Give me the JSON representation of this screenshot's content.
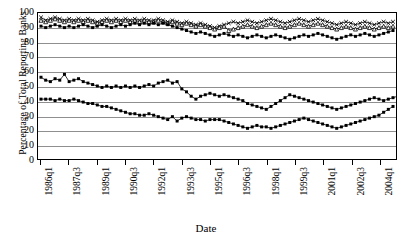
{
  "chart_data": {
    "type": "line",
    "title": "",
    "xlabel": "Date",
    "ylabel": "Percentage of Total Reporting Banks",
    "ylim": [
      0,
      100
    ],
    "yticks": [
      0,
      10,
      20,
      30,
      40,
      50,
      60,
      70,
      80,
      90,
      100
    ],
    "grid": true,
    "legend": "none",
    "x_tick_labels": [
      "1986q1",
      "1987q3",
      "1989q1",
      "1990q3",
      "1992q1",
      "1993q3",
      "1995q1",
      "1996q3",
      "1998q1",
      "1999q3",
      "2001q1",
      "2002q3",
      "2004q1"
    ],
    "x_tick_indices": [
      0,
      6,
      12,
      18,
      24,
      30,
      36,
      42,
      48,
      54,
      60,
      66,
      72
    ],
    "x_start": "1986q1",
    "x_end": "2004q4",
    "n_points": 76,
    "series": [
      {
        "name": "Series A (upper, x markers)",
        "marker": "x",
        "values": [
          97,
          95,
          96,
          97,
          96,
          95,
          96,
          95,
          96,
          95,
          96,
          95,
          94,
          95,
          96,
          95,
          96,
          95,
          96,
          95,
          96,
          95,
          96,
          95,
          95,
          96,
          95,
          94,
          95,
          94,
          93,
          94,
          93,
          92,
          93,
          92,
          91,
          90,
          91,
          92,
          93,
          94,
          93,
          94,
          95,
          94,
          93,
          94,
          95,
          96,
          95,
          94,
          93,
          94,
          95,
          96,
          95,
          94,
          95,
          96,
          95,
          94,
          93,
          92,
          93,
          94,
          93,
          92,
          93,
          94,
          93,
          92,
          93,
          94,
          93,
          94
        ]
      },
      {
        "name": "Series B (upper, triangle markers)",
        "marker": "triangle",
        "values": [
          95,
          94,
          95,
          96,
          95,
          94,
          95,
          94,
          95,
          94,
          95,
          94,
          93,
          94,
          95,
          94,
          95,
          94,
          95,
          94,
          95,
          94,
          95,
          94,
          94,
          95,
          94,
          93,
          94,
          93,
          92,
          93,
          92,
          91,
          92,
          91,
          90,
          89,
          90,
          91,
          88,
          89,
          90,
          91,
          92,
          91,
          90,
          91,
          92,
          93,
          92,
          91,
          90,
          91,
          92,
          93,
          92,
          91,
          92,
          93,
          92,
          91,
          90,
          89,
          90,
          91,
          90,
          89,
          90,
          91,
          90,
          89,
          90,
          91,
          90,
          91
        ]
      },
      {
        "name": "Series C (upper, filled square markers)",
        "marker": "square",
        "values": [
          91,
          90,
          91,
          92,
          91,
          90,
          91,
          90,
          91,
          92,
          91,
          90,
          91,
          92,
          91,
          90,
          91,
          92,
          91,
          92,
          93,
          92,
          93,
          92,
          93,
          92,
          93,
          92,
          91,
          90,
          89,
          88,
          87,
          86,
          87,
          86,
          85,
          84,
          85,
          86,
          85,
          84,
          85,
          84,
          83,
          84,
          85,
          84,
          83,
          84,
          85,
          84,
          83,
          82,
          83,
          84,
          85,
          84,
          85,
          86,
          85,
          84,
          83,
          82,
          83,
          84,
          85,
          84,
          85,
          86,
          85,
          84,
          85,
          86,
          87,
          88
        ]
      },
      {
        "name": "Series D (lower, ~50%)",
        "marker": "square",
        "values": [
          56,
          54,
          53,
          55,
          54,
          58,
          53,
          54,
          55,
          53,
          52,
          51,
          50,
          49,
          50,
          49,
          50,
          49,
          50,
          49,
          50,
          49,
          50,
          51,
          50,
          52,
          53,
          54,
          52,
          53,
          48,
          46,
          43,
          41,
          43,
          44,
          45,
          44,
          43,
          44,
          43,
          42,
          41,
          40,
          38,
          37,
          36,
          35,
          34,
          36,
          38,
          40,
          42,
          44,
          43,
          42,
          41,
          40,
          39,
          38,
          37,
          36,
          35,
          34,
          35,
          36,
          37,
          38,
          39,
          40,
          41,
          42,
          41,
          40,
          41,
          42,
          43
        ]
      },
      {
        "name": "Series E (lowest, ~30%)",
        "marker": "square",
        "values": [
          41,
          41,
          41,
          40,
          41,
          40,
          40,
          41,
          40,
          39,
          38,
          38,
          37,
          36,
          36,
          35,
          34,
          33,
          32,
          31,
          31,
          30,
          30,
          31,
          30,
          29,
          28,
          27,
          29,
          26,
          28,
          29,
          28,
          27,
          27,
          26,
          27,
          27,
          27,
          26,
          25,
          24,
          23,
          22,
          21,
          22,
          23,
          22,
          22,
          21,
          22,
          23,
          24,
          25,
          26,
          27,
          28,
          27,
          26,
          25,
          24,
          23,
          22,
          21,
          22,
          23,
          24,
          25,
          26,
          27,
          28,
          29,
          30,
          32,
          34,
          36
        ]
      }
    ]
  }
}
